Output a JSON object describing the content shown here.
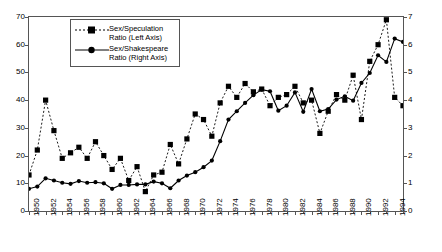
{
  "chart_data": {
    "type": "line",
    "title": "",
    "xlabel": "",
    "ylabel": "",
    "grid": false,
    "legend_position": "top-left-inside",
    "x": [
      1950,
      1951,
      1952,
      1953,
      1954,
      1955,
      1956,
      1957,
      1958,
      1959,
      1960,
      1961,
      1962,
      1963,
      1964,
      1965,
      1966,
      1967,
      1968,
      1969,
      1970,
      1971,
      1972,
      1973,
      1974,
      1975,
      1976,
      1977,
      1978,
      1979,
      1980,
      1981,
      1982,
      1983,
      1984,
      1985,
      1986,
      1987,
      1988,
      1989,
      1990,
      1991,
      1992,
      1993,
      1994,
      1995
    ],
    "x_tick_labels": [
      "1950",
      "1952",
      "1954",
      "1956",
      "1958",
      "1960",
      "1962",
      "1964",
      "1966",
      "1968",
      "1970",
      "1972",
      "1974",
      "1976",
      "1978",
      "1980",
      "1982",
      "1984",
      "1986",
      "1988",
      "1990",
      "1992",
      "1994"
    ],
    "x_tick_step": 2,
    "xlim": [
      1950,
      1995
    ],
    "series": [
      {
        "name": "Sex/Speculation Ratio (Left Axis)",
        "axis": "left",
        "marker": "square",
        "linestyle": "dashed",
        "color": "#000000",
        "ylim": [
          0,
          70
        ],
        "ytick_labels": [
          "0",
          "10",
          "20",
          "30",
          "40",
          "50",
          "60",
          "70"
        ],
        "values": [
          13,
          22,
          40,
          29,
          19,
          21,
          23,
          19,
          25,
          20,
          15,
          19,
          11,
          16,
          7,
          13,
          14,
          24,
          17,
          26,
          35,
          33,
          27,
          39,
          45,
          41,
          46,
          43,
          44,
          38,
          41,
          42,
          45,
          39,
          40,
          28,
          36,
          42,
          40,
          49,
          33,
          54,
          60,
          69,
          41,
          38
        ]
      },
      {
        "name": "Sex/Shakespeare Ratio (Right Axis)",
        "axis": "right",
        "marker": "circle",
        "linestyle": "solid",
        "color": "#000000",
        "ylim": [
          0,
          7
        ],
        "ytick_labels": [
          "0",
          "1",
          "2",
          "3",
          "4",
          "5",
          "6",
          "7"
        ],
        "values": [
          0.8,
          0.88,
          1.18,
          1.1,
          1.02,
          0.98,
          1.08,
          1.02,
          1.04,
          1.0,
          0.8,
          0.94,
          0.94,
          0.96,
          0.96,
          1.06,
          1.0,
          0.82,
          1.1,
          1.28,
          1.4,
          1.58,
          1.82,
          2.52,
          3.3,
          3.6,
          3.9,
          4.18,
          4.38,
          4.32,
          3.62,
          3.8,
          4.28,
          3.58,
          4.4,
          3.6,
          3.68,
          4.02,
          4.14,
          3.98,
          4.62,
          4.98,
          5.62,
          5.38,
          6.22,
          6.1
        ]
      }
    ],
    "legend": [
      {
        "line1": "Sex/Speculation",
        "line2": "Ratio (Left Axis)",
        "marker": "square",
        "linestyle": "dashed"
      },
      {
        "line1": "Sex/Shakespeare",
        "line2": "Ratio (Right Axis)",
        "marker": "circle",
        "linestyle": "solid"
      }
    ]
  }
}
